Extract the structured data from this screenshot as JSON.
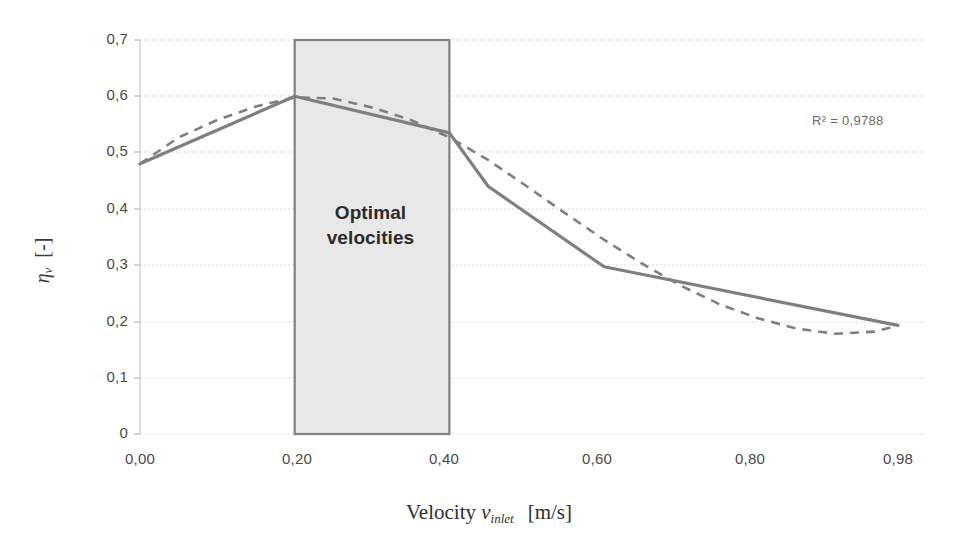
{
  "chart_data": {
    "type": "line",
    "title": "",
    "subtitle": "",
    "xlabel": "Velocity v_inlet  [m/s]",
    "ylabel": "eta_v  [-]",
    "xlim": [
      0.0,
      0.98
    ],
    "ylim": [
      0.0,
      0.7
    ],
    "grid": true,
    "legend_position": "none",
    "xticks": [
      "0,00",
      "0,20",
      "0,40",
      "0,60",
      "0,80",
      "0,98"
    ],
    "xtick_values": [
      0.0,
      0.2,
      0.4,
      0.6,
      0.8,
      0.98
    ],
    "yticks": [
      "0",
      "0,1",
      "0,2",
      "0,3",
      "0,4",
      "0,5",
      "0,6",
      "0,7"
    ],
    "ytick_values": [
      0.0,
      0.1,
      0.2,
      0.3,
      0.4,
      0.5,
      0.6,
      0.7
    ],
    "series": [
      {
        "name": "measured",
        "style": "solid",
        "color": "#7f7f7f",
        "x": [
          0.0,
          0.2,
          0.4,
          0.45,
          0.6,
          0.98
        ],
        "values": [
          0.48,
          0.6,
          0.535,
          0.44,
          0.297,
          0.193
        ]
      },
      {
        "name": "polynomial trendline",
        "style": "dashed",
        "color": "#7f7f7f",
        "x": [
          0.0,
          0.05,
          0.1,
          0.15,
          0.2,
          0.25,
          0.3,
          0.35,
          0.4,
          0.45,
          0.5,
          0.55,
          0.6,
          0.65,
          0.7,
          0.75,
          0.8,
          0.85,
          0.9,
          0.95,
          0.98
        ],
        "values": [
          0.48,
          0.527,
          0.558,
          0.582,
          0.598,
          0.596,
          0.58,
          0.558,
          0.527,
          0.487,
          0.44,
          0.392,
          0.345,
          0.302,
          0.263,
          0.23,
          0.205,
          0.187,
          0.178,
          0.182,
          0.193
        ]
      }
    ],
    "annotations": [
      {
        "name": "r-squared",
        "text": "R² = 0,9788",
        "x": 0.86,
        "y": 0.59
      },
      {
        "name": "optimal-band",
        "text": "Optimal velocities",
        "x_start": 0.2,
        "x_end": 0.4,
        "y_start": 0.0,
        "y_end": 0.7,
        "fill": "#e8e8e8",
        "stroke": "#808080"
      }
    ]
  },
  "annotation_text": {
    "r_squared": "R² = 0,9788",
    "band_line1": "Optimal",
    "band_line2": "velocities"
  },
  "axis_titles": {
    "x_main": "Velocity",
    "x_symbol": "v",
    "x_symbol_sub": "inlet",
    "x_unit": "[m/s]",
    "y_symbol": "η",
    "y_symbol_sub": "v",
    "y_unit": "[-]"
  },
  "colors": {
    "series_line": "#7f7f7f",
    "trendline": "#7f7f7f",
    "band_fill": "#e9e9e9",
    "band_stroke": "#7d7d7d",
    "gridline": "#d8d8d8",
    "axis": "#c9c9c9",
    "tick_text": "#4a4a4a"
  }
}
